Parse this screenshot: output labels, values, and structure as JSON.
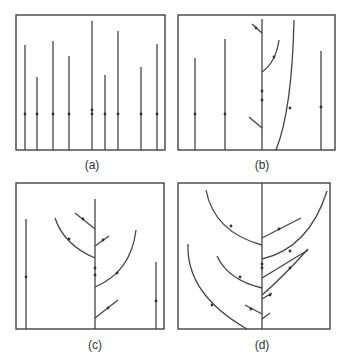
{
  "panels": [
    {
      "label": "(a)",
      "label_pos": [
        92,
        158
      ],
      "frame": [
        16,
        15,
        149,
        135
      ],
      "paths": [
        "M25 150 L25 45",
        "M37 150 L37 77",
        "M53 150 L53 41",
        "M69 150 L69 56",
        "M92 150 L92 21",
        "M105 150 L105 75",
        "M118 150 L118 31",
        "M141 150 L141 67",
        "M157 150 L157 44"
      ],
      "dots": [
        [
          25,
          114
        ],
        [
          37,
          114
        ],
        [
          53,
          114
        ],
        [
          69,
          114
        ],
        [
          92,
          110
        ],
        [
          92,
          114
        ],
        [
          105,
          114
        ],
        [
          118,
          114
        ],
        [
          141,
          114
        ],
        [
          157,
          114
        ]
      ]
    },
    {
      "label": "(b)",
      "label_pos": [
        262,
        158
      ],
      "frame": [
        178,
        15,
        157,
        135
      ],
      "paths": [
        "M195 150 L195 58",
        "M225 150 L225 39",
        "M262 150 L262 19",
        "M276 150 Q292 110 294 20",
        "M321 150 L321 51",
        "M252 24 L262 33",
        "M262 72 Q276 62 279 40",
        "M249 117 L262 128"
      ],
      "dots": [
        [
          195,
          114
        ],
        [
          225,
          114
        ],
        [
          262,
          91
        ],
        [
          262,
          100
        ],
        [
          290,
          108
        ],
        [
          321,
          107
        ],
        [
          274,
          57
        ],
        [
          256,
          28
        ]
      ]
    },
    {
      "label": "(c)",
      "label_pos": [
        95,
        338
      ],
      "frame": [
        16,
        183,
        148,
        146
      ],
      "paths": [
        "M26 329 L26 219",
        "M95 329 L95 199",
        "M156 329 L156 262",
        "M75 213 L95 229",
        "M55 218 Q64 245 95 258",
        "M95 246 L109 236",
        "M95 287 Q131 272 136 230",
        "M95 318 L118 300"
      ],
      "dots": [
        [
          26,
          277
        ],
        [
          95,
          268
        ],
        [
          95,
          275
        ],
        [
          156,
          301
        ],
        [
          83,
          219
        ],
        [
          69,
          239
        ],
        [
          103,
          240
        ],
        [
          117,
          273
        ],
        [
          108,
          308
        ]
      ]
    },
    {
      "label": "(d)",
      "label_pos": [
        262,
        338
      ],
      "frame": [
        178,
        183,
        152,
        146
      ],
      "paths": [
        "M262 329 L262 183",
        "M206 190 Q214 232 262 245",
        "M217 256 Q228 280 262 288",
        "M188 244 Q186 294 247 329",
        "M245 305 L262 314",
        "M262 238 L301 218",
        "M262 259 Q309 248 327 191",
        "M262 278 L308 250",
        "M262 295 Q283 277 308 249",
        "M262 299 L272 293",
        "M262 319 L270 313"
      ],
      "dots": [
        [
          231,
          226
        ],
        [
          240,
          277
        ],
        [
          212,
          305
        ],
        [
          251,
          309
        ],
        [
          279,
          229
        ],
        [
          290,
          251
        ],
        [
          290,
          268
        ],
        [
          262,
          264
        ],
        [
          262,
          268
        ],
        [
          270,
          295
        ]
      ]
    }
  ]
}
